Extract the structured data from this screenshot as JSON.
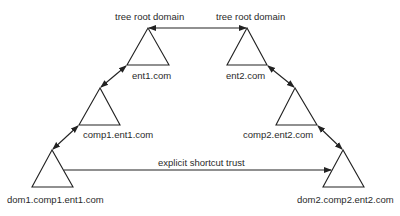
{
  "diagram": {
    "nodes": [
      {
        "id": "ent1",
        "label": "ent1.com",
        "role_label": "tree root domain"
      },
      {
        "id": "ent2",
        "label": "ent2.com",
        "role_label": "tree root domain"
      },
      {
        "id": "comp1",
        "label": "comp1.ent1.com"
      },
      {
        "id": "comp2",
        "label": "comp2.ent2.com"
      },
      {
        "id": "dom1",
        "label": "dom1.comp1.ent1.com"
      },
      {
        "id": "dom2",
        "label": "dom2.comp2.ent2.com"
      }
    ],
    "edges": [
      {
        "from": "ent1",
        "to": "ent2",
        "type": "bidirectional"
      },
      {
        "from": "ent1",
        "to": "comp1",
        "type": "bidirectional"
      },
      {
        "from": "comp1",
        "to": "dom1",
        "type": "bidirectional"
      },
      {
        "from": "ent2",
        "to": "comp2",
        "type": "bidirectional"
      },
      {
        "from": "comp2",
        "to": "dom2",
        "type": "bidirectional"
      },
      {
        "from": "dom1",
        "to": "dom2",
        "type": "one-way",
        "label": "explicit shortcut trust"
      }
    ],
    "shortcut_label": "explicit shortcut trust"
  }
}
